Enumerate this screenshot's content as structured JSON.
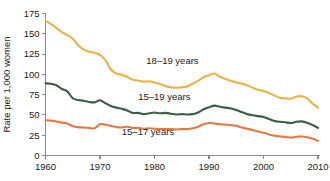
{
  "chart_data": {
    "type": "line",
    "title": "",
    "xlabel": "",
    "ylabel": "Rate per 1,000 women",
    "xlim": [
      1960,
      2010
    ],
    "ylim": [
      0,
      175
    ],
    "grid": false,
    "legend_position": "inline-annotations",
    "xticks": [
      "1960",
      "1970",
      "1980",
      "1990",
      "2000",
      "2010"
    ],
    "xtick_values": [
      1960,
      1970,
      1980,
      1990,
      2000,
      2010
    ],
    "yticks": [
      "0",
      "25",
      "50",
      "75",
      "100",
      "125",
      "150",
      "175"
    ],
    "ytick_values": [
      0,
      25,
      50,
      75,
      100,
      125,
      150,
      175
    ],
    "x": [
      1960,
      1961,
      1962,
      1963,
      1964,
      1965,
      1966,
      1967,
      1968,
      1969,
      1970,
      1971,
      1972,
      1973,
      1974,
      1975,
      1976,
      1977,
      1978,
      1979,
      1980,
      1981,
      1982,
      1983,
      1984,
      1985,
      1986,
      1987,
      1988,
      1989,
      1990,
      1991,
      1992,
      1993,
      1994,
      1995,
      1996,
      1997,
      1998,
      1999,
      2000,
      2001,
      2002,
      2003,
      2004,
      2005,
      2006,
      2007,
      2008,
      2009,
      2010
    ],
    "series": [
      {
        "name": "18-19 years",
        "label": "18–19 years",
        "color": "#e8b349",
        "values": [
          166.0,
          162.0,
          157.0,
          152.0,
          148.5,
          144.0,
          136.0,
          130.5,
          128.0,
          126.5,
          124.0,
          117.5,
          106.0,
          101.0,
          99.5,
          97.0,
          93.5,
          92.5,
          91.0,
          91.5,
          90.0,
          88.0,
          85.5,
          84.0,
          83.5,
          84.0,
          85.0,
          88.5,
          92.0,
          96.5,
          99.0,
          101.0,
          97.0,
          94.5,
          92.0,
          90.0,
          88.5,
          86.5,
          83.5,
          81.0,
          79.5,
          77.0,
          74.0,
          71.0,
          70.5,
          70.0,
          72.5,
          73.0,
          70.5,
          64.0,
          59.0
        ]
      },
      {
        "name": "15-19 years",
        "label": "15–19 years",
        "color": "#3f5c47",
        "values": [
          89.0,
          88.5,
          86.5,
          82.0,
          79.0,
          70.5,
          68.5,
          67.5,
          66.0,
          65.5,
          68.0,
          64.5,
          61.0,
          59.0,
          57.5,
          55.5,
          52.5,
          52.5,
          51.0,
          52.0,
          53.0,
          52.0,
          52.5,
          51.5,
          50.5,
          51.0,
          50.5,
          51.0,
          53.0,
          57.0,
          59.5,
          61.5,
          60.0,
          59.0,
          58.0,
          56.0,
          53.5,
          51.0,
          49.5,
          48.5,
          47.5,
          45.0,
          42.5,
          41.5,
          41.0,
          40.0,
          41.5,
          42.0,
          40.5,
          37.5,
          34.0
        ]
      },
      {
        "name": "15-17 years",
        "label": "15–17 years",
        "color": "#e07b46",
        "values": [
          43.5,
          43.0,
          42.0,
          40.5,
          39.5,
          36.0,
          35.0,
          34.5,
          34.0,
          33.5,
          38.5,
          38.0,
          36.5,
          35.0,
          34.5,
          35.5,
          34.0,
          34.0,
          33.0,
          33.5,
          33.0,
          32.5,
          32.5,
          32.5,
          32.0,
          32.5,
          32.5,
          33.5,
          35.5,
          38.5,
          40.0,
          39.5,
          38.5,
          38.0,
          37.5,
          36.5,
          34.5,
          33.0,
          31.5,
          29.5,
          28.0,
          26.0,
          24.5,
          23.5,
          23.0,
          22.0,
          23.0,
          23.5,
          22.5,
          20.5,
          18.0
        ]
      }
    ],
    "annotations": [
      {
        "text": "18–19 years",
        "x": 1978.5,
        "y": 113.0
      },
      {
        "text": "15–19 years",
        "x": 1977.0,
        "y": 68.0
      },
      {
        "text": "15–17 years",
        "x": 1974.0,
        "y": 25.0
      }
    ]
  }
}
